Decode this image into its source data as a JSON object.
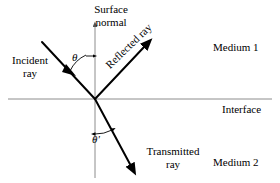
{
  "figure": {
    "background_color": "#ffffff",
    "ray_color": "#000000",
    "axis_color": "#8c8c8c"
  },
  "labels": {
    "surface_normal_line1": "Surface",
    "surface_normal_line2": "normal",
    "incident_ray_line1": "Incident",
    "incident_ray_line2": "ray",
    "reflected_ray": "Reflected  ray",
    "transmitted_ray_line1": "Transmitted",
    "transmitted_ray_line2": "ray",
    "medium_1": "Medium 1",
    "medium_2": "Medium 2",
    "interface": "Interface",
    "angle_incidence": "θ",
    "angle_refraction": "θ'"
  },
  "geometry": {
    "origin_x": 95,
    "origin_y": 99,
    "normal_top_y": 22,
    "normal_bottom_y": 178,
    "interface_left_x": 8,
    "interface_right_x": 272,
    "incident_start_x": 42,
    "incident_start_y": 42,
    "reflected_end_x": 148,
    "reflected_end_y": 42,
    "transmitted_end_x": 134,
    "transmitted_end_y": 170
  }
}
